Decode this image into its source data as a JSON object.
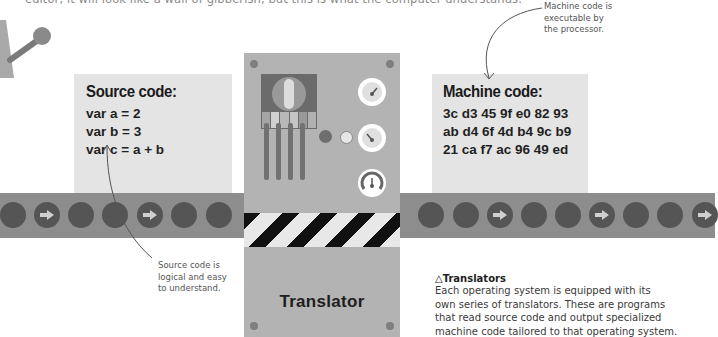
{
  "intro_text": "editor, it will look like a wall of gibberish, but this is what the computer understands.",
  "source_panel": {
    "title": "Source code:",
    "lines": [
      "var a = 2",
      "var b = 3",
      "var c = a + b"
    ]
  },
  "machine_panel": {
    "title": "Machine code:",
    "lines": [
      "3c d3 45 9f e0 82 93",
      "ab d4 6f 4d b4 9c b9",
      "21 ca f7 ac 96 49 ed"
    ]
  },
  "annotations": {
    "source_note": [
      "Source code is",
      "logical and easy",
      "to understand."
    ],
    "machine_note": [
      "Machine code is",
      "executable by",
      "the processor."
    ]
  },
  "translator": {
    "label": "Translator",
    "gauges": 3,
    "indicator_lights": 2
  },
  "caption": {
    "marker": "△",
    "title": "Translators",
    "lines": [
      "Each operating system is equipped with its",
      "own series of translators. These are programs",
      "that read source code and output specialized",
      "machine code tailored to that operating system."
    ]
  },
  "colors": {
    "conveyor": "#8d8d8d",
    "roller": "#555555",
    "code_panel": "#e4e4e4",
    "machine_body": "#b3b3b3",
    "hazard_dark": "#111111",
    "hazard_light": "#e8e8e8"
  }
}
